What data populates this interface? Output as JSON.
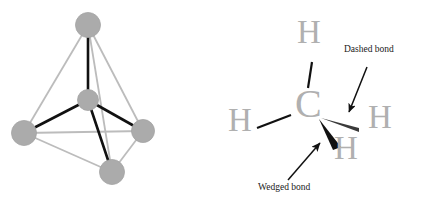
{
  "figure": {
    "background_color": "#ffffff"
  },
  "colors": {
    "sphere_fill": "#ababab",
    "sphere_edge": "#a0a0a0",
    "cage_edge": "#bcbcbc",
    "center_bond": "#111111",
    "atom_text": "#b0b0b0",
    "annotation_text": "#1a1a1a",
    "wedge_fill": "#111111",
    "dash_fill": "#3a3a3a",
    "plain_bond": "#111111",
    "arrow": "#111111"
  },
  "model_3d": {
    "name": "ball-and-stick-tetrahedron",
    "atoms": [
      {
        "id": "center",
        "role": "central-atom",
        "cx": 88,
        "cy": 100,
        "r": 10.5
      },
      {
        "id": "vertex-top",
        "role": "outer-atom",
        "cx": 88,
        "cy": 25,
        "r": 12.5
      },
      {
        "id": "vertex-left",
        "role": "outer-atom",
        "cx": 24,
        "cy": 133,
        "r": 12.5
      },
      {
        "id": "vertex-right",
        "role": "outer-atom",
        "cx": 143,
        "cy": 131,
        "r": 11.5
      },
      {
        "id": "vertex-bottom",
        "role": "outer-atom",
        "cx": 112,
        "cy": 172,
        "r": 12.5
      }
    ],
    "center_bonds": [
      {
        "from": "center",
        "to": "vertex-top"
      },
      {
        "from": "center",
        "to": "vertex-left"
      },
      {
        "from": "center",
        "to": "vertex-right"
      },
      {
        "from": "center",
        "to": "vertex-bottom"
      }
    ],
    "cage_edges": [
      {
        "from": "vertex-top",
        "to": "vertex-left"
      },
      {
        "from": "vertex-top",
        "to": "vertex-right"
      },
      {
        "from": "vertex-top",
        "to": "vertex-bottom"
      },
      {
        "from": "vertex-left",
        "to": "vertex-right"
      },
      {
        "from": "vertex-left",
        "to": "vertex-bottom"
      },
      {
        "from": "vertex-right",
        "to": "vertex-bottom"
      }
    ]
  },
  "structure_2d": {
    "name": "wedge-dash-structure",
    "central_atom": {
      "symbol": "C",
      "x": 295,
      "y": 99,
      "font_size": 36
    },
    "hydrogens": [
      {
        "id": "h-top",
        "symbol": "H",
        "x": 297,
        "y": 24,
        "font_size": 30,
        "bond": "plain"
      },
      {
        "id": "h-left",
        "symbol": "H",
        "x": 228,
        "y": 112,
        "font_size": 30,
        "bond": "plain"
      },
      {
        "id": "h-right",
        "symbol": "H",
        "x": 368,
        "y": 109,
        "font_size": 30,
        "bond": "dashed"
      },
      {
        "id": "h-bottom",
        "symbol": "H",
        "x": 334,
        "y": 140,
        "font_size": 30,
        "bond": "wedged"
      }
    ]
  },
  "annotations": [
    {
      "id": "dashed-bond-annotation",
      "label": "Dashed bond",
      "label_x": 344,
      "label_y": 50,
      "arrow_from": [
        367,
        67
      ],
      "arrow_to": [
        349,
        114
      ]
    },
    {
      "id": "wedged-bond-annotation",
      "label": "Wedged bond",
      "label_x": 258,
      "label_y": 188,
      "arrow_from": [
        288,
        180
      ],
      "arrow_to": [
        320,
        143
      ]
    }
  ]
}
